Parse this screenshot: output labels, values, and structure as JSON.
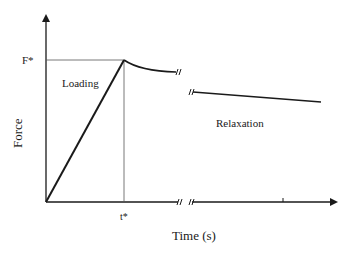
{
  "diagram": {
    "type": "force-time loading/relaxation diagram",
    "y_axis_label": "Force",
    "x_axis_label": "Time (s)",
    "peak_force_label": "F*",
    "peak_time_label": "t*",
    "regions": {
      "loading": "Loading",
      "relaxation": "Relaxation"
    },
    "break_mark": "//",
    "colors": {
      "line": "#1a1a1a",
      "background": "#ffffff"
    }
  }
}
